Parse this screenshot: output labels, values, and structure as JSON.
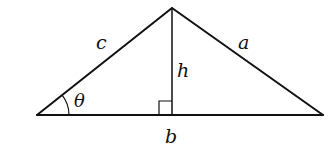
{
  "diagram": {
    "colors": {
      "stroke": "#111111",
      "background": "#ffffff"
    },
    "vertices": {
      "left": [
        37,
        115
      ],
      "top": [
        172,
        8
      ],
      "right": [
        323,
        115
      ],
      "foot": [
        172,
        115
      ]
    },
    "labels": {
      "side_c": "c",
      "side_a": "a",
      "altitude_h": "h",
      "angle_theta": "θ",
      "base_b": "b"
    },
    "annotations": {
      "right_angle_marker": "square at foot of altitude",
      "angle_arc": "arc marking angle θ at left vertex"
    }
  }
}
